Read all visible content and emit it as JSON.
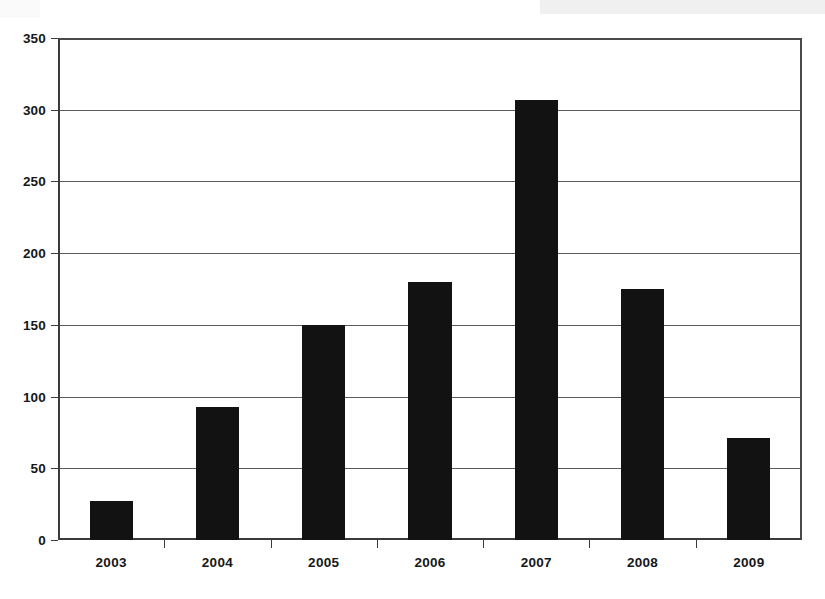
{
  "chart_data": {
    "type": "bar",
    "title": "",
    "subtitle": "",
    "xlabel": "",
    "ylabel": "",
    "categories": [
      "2003",
      "2004",
      "2005",
      "2006",
      "2007",
      "2008",
      "2009"
    ],
    "values": [
      27,
      93,
      150,
      180,
      307,
      175,
      71
    ],
    "series": [
      {
        "name": "",
        "values": [
          27,
          93,
          150,
          180,
          307,
          175,
          71
        ]
      }
    ],
    "ylim": [
      0,
      350
    ],
    "yticks": [
      0,
      50,
      100,
      150,
      200,
      250,
      300,
      350
    ],
    "ytick_labels": [
      "0",
      "50",
      "100",
      "150",
      "200",
      "250",
      "300",
      "350"
    ],
    "grid": true,
    "grid_axis": "y",
    "legend": false,
    "legend_position": "none",
    "bar_color": "#121212",
    "axis_color": "#3b3b3b",
    "grid_color": "#5a5a5a",
    "background_color": "#ffffff",
    "annotations": []
  }
}
